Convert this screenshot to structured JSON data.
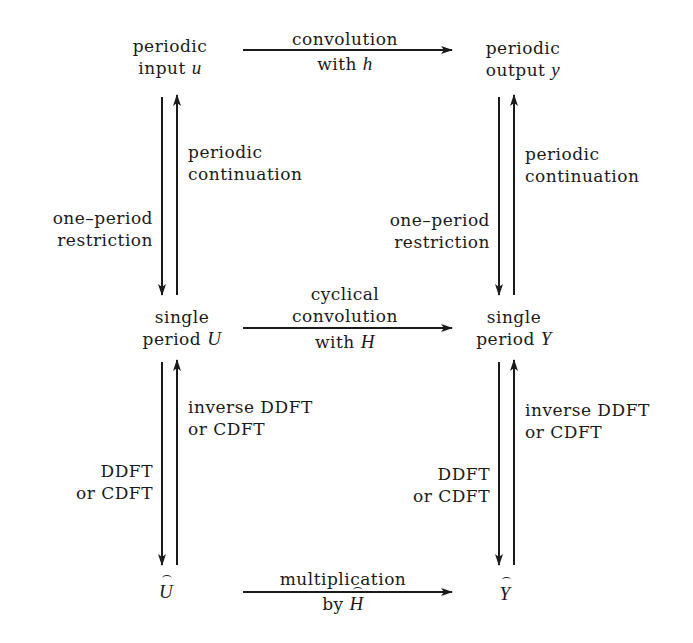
{
  "nodes": {
    "top_left": {
      "line1": "periodic",
      "line2": "input ",
      "var": "u"
    },
    "top_right": {
      "line1": "periodic",
      "line2": "output ",
      "var": "y"
    },
    "mid_left": {
      "line1": "single",
      "line2": "period ",
      "var": "U"
    },
    "mid_right": {
      "line1": "single",
      "line2": "period ",
      "var": "Y"
    },
    "bot_left": {
      "var": "U",
      "hat": true
    },
    "bot_right": {
      "var": "Y",
      "hat": true
    }
  },
  "edges": {
    "top_horizontal": {
      "line1": "convolution",
      "line2": "with ",
      "var": "h"
    },
    "mid_horizontal": {
      "line1": "cyclical",
      "line2": "convolution",
      "line3": "with ",
      "var": "H"
    },
    "bot_horizontal": {
      "line1": "multiplication",
      "line2": "by ",
      "var": "H",
      "hat": true
    },
    "left_upper_up": {
      "line1": "periodic",
      "line2": "continuation"
    },
    "left_upper_down": {
      "line1": "one–period",
      "line2": "restriction"
    },
    "right_upper_up": {
      "line1": "periodic",
      "line2": "continuation"
    },
    "right_upper_down": {
      "line1": "one–period",
      "line2": "restriction"
    },
    "left_lower_up": {
      "line1": "inverse DDFT",
      "line2": "or CDFT"
    },
    "left_lower_down": {
      "line1": "DDFT",
      "line2": "or CDFT"
    },
    "right_lower_up": {
      "line1": "inverse DDFT",
      "line2": "or CDFT"
    },
    "right_lower_down": {
      "line1": "DDFT",
      "line2": "or CDFT"
    }
  },
  "colors": {
    "ink": "#1a1a1a",
    "background": "#ffffff"
  }
}
